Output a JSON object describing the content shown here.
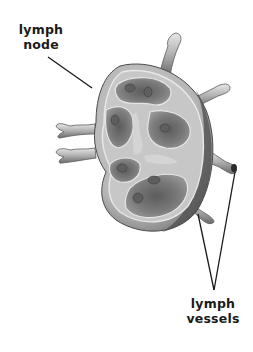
{
  "figure": {
    "labels": {
      "node": {
        "line1": "lymph",
        "line2": "node"
      },
      "vessels": {
        "line1": "lymph",
        "line2": "vessels"
      }
    },
    "colors": {
      "background": "#ffffff",
      "text": "#1a1a1a",
      "outline_dark": "#3a3a3a",
      "capsule": "#bdbdbd",
      "cortex": "#8c8c8c",
      "follicle_center": "#6a6a6a",
      "medulla_light": "#d4d4d4"
    }
  }
}
